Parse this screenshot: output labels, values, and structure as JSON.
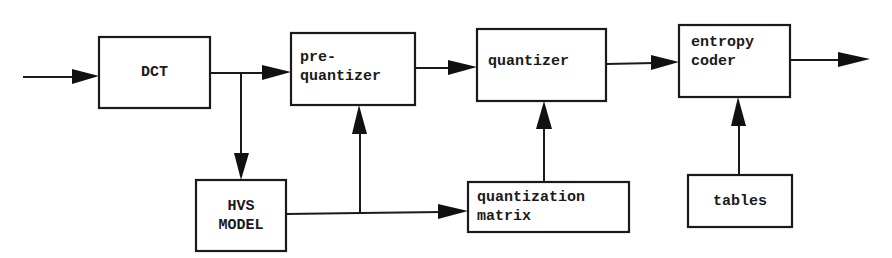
{
  "diagram": {
    "type": "block-diagram",
    "blocks": [
      {
        "id": "dct",
        "label": "DCT"
      },
      {
        "id": "prequantizer",
        "lines": [
          "pre-",
          "quantizer"
        ]
      },
      {
        "id": "quantizer",
        "label": "quantizer"
      },
      {
        "id": "entropy_coder",
        "lines": [
          "entropy",
          "coder"
        ]
      },
      {
        "id": "hvs_model",
        "lines": [
          "HVS",
          "MODEL"
        ]
      },
      {
        "id": "quantization_matrix",
        "lines": [
          "quantization",
          "matrix"
        ]
      },
      {
        "id": "tables",
        "label": "tables"
      }
    ],
    "edges": [
      {
        "from": "input",
        "to": "dct"
      },
      {
        "from": "dct",
        "to": "prequantizer"
      },
      {
        "from": "dct",
        "to": "hvs_model"
      },
      {
        "from": "hvs_model",
        "to": "prequantizer"
      },
      {
        "from": "hvs_model",
        "to": "quantization_matrix"
      },
      {
        "from": "prequantizer",
        "to": "quantizer"
      },
      {
        "from": "quantization_matrix",
        "to": "quantizer"
      },
      {
        "from": "quantizer",
        "to": "entropy_coder"
      },
      {
        "from": "tables",
        "to": "entropy_coder"
      },
      {
        "from": "entropy_coder",
        "to": "output"
      }
    ],
    "colors": {
      "stroke": "#1a1a1a",
      "background": "#ffffff"
    }
  }
}
